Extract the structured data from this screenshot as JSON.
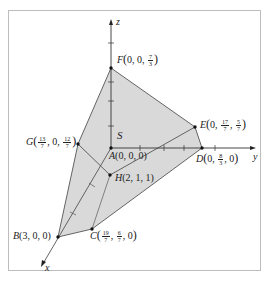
{
  "diagram": {
    "type": "3d-polyhedron-region",
    "region_label": "S",
    "axes": {
      "x": {
        "label": "x"
      },
      "y": {
        "label": "y"
      },
      "z": {
        "label": "z"
      }
    },
    "points": {
      "A": {
        "name": "A",
        "coords": "(0, 0, 0)"
      },
      "B": {
        "name": "B",
        "coords": "(3, 0, 0)"
      },
      "C": {
        "name": "C",
        "coords_parts": [
          "19/7",
          "6/7",
          "0"
        ]
      },
      "D": {
        "name": "D",
        "coords_parts": [
          "0",
          "8/3",
          "0"
        ]
      },
      "E": {
        "name": "E",
        "coords_parts": [
          "0",
          "17/7",
          "5/7"
        ]
      },
      "F": {
        "name": "F",
        "coords_parts": [
          "0",
          "0",
          "7/3"
        ]
      },
      "G": {
        "name": "G",
        "coords_parts": [
          "13/7",
          "0",
          "12/7"
        ]
      },
      "H": {
        "name": "H",
        "coords": "(2, 1, 1)"
      }
    },
    "labels": {
      "A_name": "A",
      "A_coords": "(0, 0, 0)",
      "B_name": "B",
      "B_coords": "(3, 0, 0)",
      "H_name": "H",
      "H_coords": "(2, 1, 1)",
      "C_name": "C",
      "C_x_num": "19",
      "C_x_den": "7",
      "C_y_num": "6",
      "C_y_den": "7",
      "C_z": "0",
      "D_name": "D",
      "D_x": "0",
      "D_y_num": "8",
      "D_y_den": "3",
      "D_z": "0",
      "E_name": "E",
      "E_x": "0",
      "E_y_num": "17",
      "E_y_den": "7",
      "E_z_num": "5",
      "E_z_den": "7",
      "F_name": "F",
      "F_x": "0",
      "F_y": "0",
      "F_z_num": "7",
      "F_z_den": "3",
      "G_name": "G",
      "G_x_num": "13",
      "G_x_den": "7",
      "G_y": "0",
      "G_z_num": "12",
      "G_z_den": "7",
      "S": "S",
      "x_axis": "x",
      "y_axis": "y",
      "z_axis": "z"
    },
    "colors": {
      "fill": "#d9d9d9",
      "edge": "#555555",
      "axis": "#333333",
      "point": "#111111",
      "frame": "#bdbdbd"
    }
  }
}
